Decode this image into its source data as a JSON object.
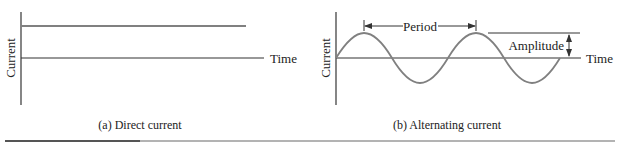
{
  "panels": [
    {
      "id": "a",
      "caption": "(a) Direct current",
      "y_label": "Current",
      "x_label": "Time"
    },
    {
      "id": "b",
      "caption": "(b) Alternating current",
      "y_label": "Current",
      "x_label": "Time",
      "annotations": {
        "period": "Period",
        "amplitude": "Amplitude"
      }
    }
  ],
  "colors": {
    "axis": "#333333",
    "signal": "#808080",
    "rule_dark": "#555555",
    "rule_light": "#9a9a9a"
  }
}
